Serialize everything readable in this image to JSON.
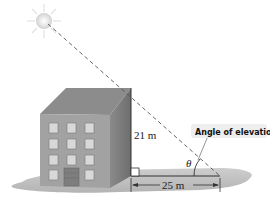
{
  "diagram": {
    "callout_label": "Angle of elevation",
    "height_label": "21 m",
    "distance_label": "25 m",
    "angle_symbol": "θ",
    "elements": [
      "sun",
      "building",
      "ground",
      "line-of-sight",
      "right-angle-marker"
    ]
  },
  "colors": {
    "building_front": "#9e9e9e",
    "building_side": "#7a7a7a",
    "building_roof": "#8a8a8a",
    "ground": "#b0b0b0",
    "sun": "#e8e8e8"
  }
}
